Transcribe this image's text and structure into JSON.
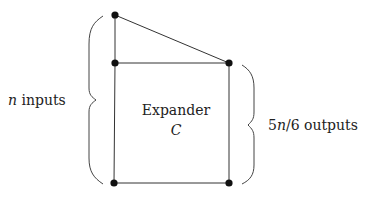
{
  "diagram": {
    "box_label": "Expander",
    "box_symbol": "C",
    "left_label_var": "n",
    "left_label_text": " inputs",
    "right_label_num": "5",
    "right_label_var": "n",
    "right_label_frac": "/6",
    "right_label_text": " outputs",
    "colors": {
      "line": "#333333",
      "node": "#111111",
      "text": "#222222"
    },
    "nodes": [
      {
        "id": "input-top",
        "x": 115,
        "y": 15
      },
      {
        "id": "input-mid",
        "x": 115,
        "y": 63
      },
      {
        "id": "output-top",
        "x": 229,
        "y": 63
      },
      {
        "id": "input-bottom",
        "x": 114,
        "y": 183
      },
      {
        "id": "output-bottom",
        "x": 229,
        "y": 183
      }
    ]
  }
}
